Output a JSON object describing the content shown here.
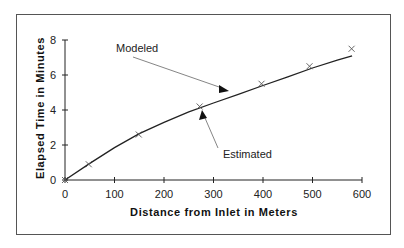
{
  "chart_data": {
    "type": "line",
    "title": "",
    "xlabel": "Distance from Inlet in Meters",
    "ylabel": "Elapsed Time in Minutes",
    "xlim": [
      0,
      600
    ],
    "ylim": [
      0,
      8
    ],
    "xticks": [
      0,
      100,
      200,
      300,
      400,
      500,
      600
    ],
    "yticks": [
      0,
      2,
      4,
      6,
      8
    ],
    "grid": false,
    "legend": null,
    "series": [
      {
        "name": "Modeled",
        "style": "line",
        "x": [
          0,
          50,
          100,
          150,
          200,
          250,
          300,
          350,
          400,
          450,
          500,
          550,
          580
        ],
        "y": [
          0,
          0.95,
          1.85,
          2.65,
          3.3,
          3.9,
          4.4,
          4.9,
          5.4,
          5.9,
          6.4,
          6.85,
          7.1
        ]
      },
      {
        "name": "Estimated",
        "style": "x-markers",
        "x": [
          0,
          48,
          149,
          272,
          397,
          494,
          579
        ],
        "y": [
          0,
          0.9,
          2.6,
          4.2,
          5.5,
          6.5,
          7.5
        ]
      }
    ],
    "annotations": [
      {
        "text": "Modeled",
        "points_to": "line"
      },
      {
        "text": "Estimated",
        "points_to": "markers"
      }
    ]
  },
  "labels": {
    "xlabel": "Distance from Inlet in Meters",
    "ylabel": "Elapsed Time in Minutes",
    "modeled": "Modeled",
    "estimated": "Estimated",
    "xticks": [
      "0",
      "100",
      "200",
      "300",
      "400",
      "500",
      "600"
    ],
    "yticks": [
      "0",
      "2",
      "4",
      "6",
      "8"
    ]
  }
}
